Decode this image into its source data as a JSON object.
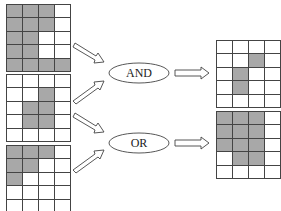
{
  "grids": {
    "input_a": [
      [
        1,
        1,
        1,
        0
      ],
      [
        1,
        1,
        1,
        0
      ],
      [
        1,
        1,
        0,
        0
      ],
      [
        1,
        1,
        0,
        0
      ],
      [
        1,
        1,
        1,
        1
      ]
    ],
    "input_b": [
      [
        0,
        0,
        0,
        0
      ],
      [
        0,
        0,
        1,
        0
      ],
      [
        0,
        1,
        1,
        0
      ],
      [
        0,
        1,
        1,
        0
      ],
      [
        0,
        0,
        0,
        0
      ]
    ],
    "input_c": [
      [
        1,
        1,
        1,
        0
      ],
      [
        1,
        1,
        0,
        0
      ],
      [
        1,
        0,
        0,
        0
      ],
      [
        0,
        0,
        0,
        0
      ],
      [
        0,
        0,
        0,
        0
      ]
    ],
    "and_result": [
      [
        0,
        0,
        0,
        0
      ],
      [
        0,
        0,
        1,
        0
      ],
      [
        0,
        1,
        0,
        0
      ],
      [
        0,
        1,
        0,
        0
      ],
      [
        0,
        0,
        0,
        0
      ]
    ],
    "or_result": [
      [
        1,
        1,
        1,
        0
      ],
      [
        1,
        1,
        1,
        0
      ],
      [
        1,
        1,
        1,
        0
      ],
      [
        0,
        1,
        1,
        0
      ],
      [
        0,
        0,
        0,
        0
      ]
    ]
  },
  "operations": {
    "and_label": "AND",
    "or_label": "OR"
  },
  "colors": {
    "filled": "#a8a8a8",
    "empty": "#ffffff",
    "line": "#444444"
  }
}
